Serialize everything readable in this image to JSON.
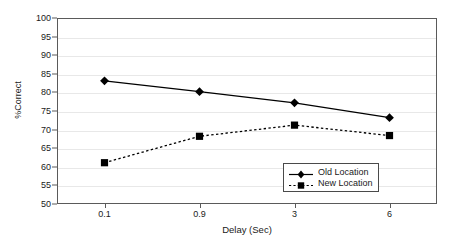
{
  "chart_data": {
    "type": "line",
    "title": "",
    "xlabel": "Delay (Sec)",
    "ylabel": "%Correct",
    "categories": [
      "0.1",
      "0.9",
      "3",
      "6"
    ],
    "ylim": [
      50,
      100
    ],
    "yticks": [
      50,
      55,
      60,
      65,
      70,
      75,
      80,
      85,
      90,
      95,
      100
    ],
    "grid": true,
    "legend_position": "inside-bottom-right",
    "series": [
      {
        "name": "Old Location",
        "values": [
          83.1,
          80.2,
          77.2,
          73.2
        ],
        "marker": "diamond",
        "linestyle": "solid",
        "color": "#000000"
      },
      {
        "name": "New Location",
        "values": [
          61.1,
          68.2,
          71.2,
          68.4
        ],
        "marker": "square",
        "linestyle": "dashed",
        "color": "#000000"
      }
    ]
  },
  "axes": {
    "y_tick_labels": [
      "100",
      "95",
      "90",
      "85",
      "80",
      "75",
      "70",
      "65",
      "60",
      "55",
      "50"
    ],
    "x_tick_labels": [
      "0.1",
      "0.9",
      "3",
      "6"
    ]
  },
  "legend": {
    "items": [
      {
        "label": "Old Location"
      },
      {
        "label": "New Location"
      }
    ]
  },
  "colors": {
    "frame": "#5a5a5a",
    "grid": "#e8e8e8",
    "series": "#000000",
    "text": "#1a1a1a",
    "background": "#ffffff"
  }
}
